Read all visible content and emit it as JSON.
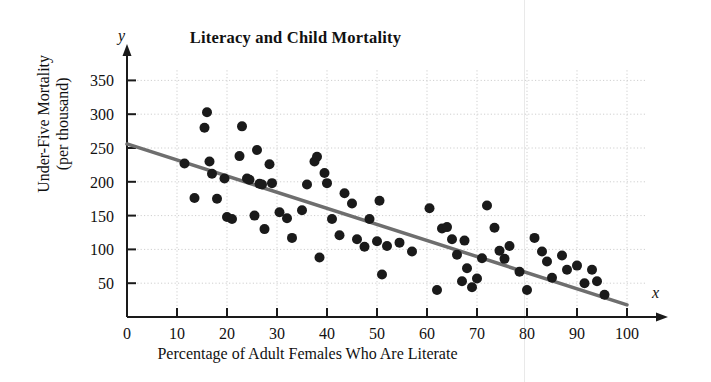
{
  "chart_data": {
    "type": "scatter",
    "title": "Literacy and Child Mortality",
    "xlabel": "Percentage of Adult Females Who Are Literate",
    "ylabel": "Under-Five Mortality\n(per thousand)",
    "ylabel_line1": "Under-Five Mortality",
    "ylabel_line2": "(per thousand)",
    "x_axis_variable": "x",
    "y_axis_variable": "y",
    "xlim": [
      0,
      100
    ],
    "ylim": [
      0,
      365
    ],
    "xticks": [
      0,
      10,
      20,
      30,
      40,
      50,
      60,
      70,
      80,
      90,
      100
    ],
    "yticks": [
      50,
      100,
      150,
      200,
      250,
      300,
      350
    ],
    "grid": true,
    "grid_style": "dotted",
    "legend": null,
    "point_color": "#1a1a1a",
    "point_radius_px": 5,
    "trendline": {
      "name": "least-squares regression line",
      "color": "#6e6e6e",
      "width_px": 3.5,
      "x0": 0,
      "y0": 256,
      "x1": 100,
      "y1": 18
    },
    "points": [
      {
        "x": 11.5,
        "y": 227
      },
      {
        "x": 13.5,
        "y": 176
      },
      {
        "x": 15.5,
        "y": 280
      },
      {
        "x": 16.0,
        "y": 303
      },
      {
        "x": 16.5,
        "y": 230
      },
      {
        "x": 17.0,
        "y": 212
      },
      {
        "x": 18.0,
        "y": 175
      },
      {
        "x": 19.5,
        "y": 205
      },
      {
        "x": 20.0,
        "y": 148
      },
      {
        "x": 21.0,
        "y": 145
      },
      {
        "x": 22.5,
        "y": 238
      },
      {
        "x": 23.0,
        "y": 282
      },
      {
        "x": 24.0,
        "y": 205
      },
      {
        "x": 24.5,
        "y": 203
      },
      {
        "x": 25.5,
        "y": 150
      },
      {
        "x": 26.0,
        "y": 247
      },
      {
        "x": 26.5,
        "y": 197
      },
      {
        "x": 27.0,
        "y": 196
      },
      {
        "x": 27.5,
        "y": 130
      },
      {
        "x": 28.5,
        "y": 226
      },
      {
        "x": 29.0,
        "y": 198
      },
      {
        "x": 30.5,
        "y": 155
      },
      {
        "x": 32.0,
        "y": 146
      },
      {
        "x": 33.0,
        "y": 117
      },
      {
        "x": 35.0,
        "y": 158
      },
      {
        "x": 36.0,
        "y": 196
      },
      {
        "x": 37.5,
        "y": 230
      },
      {
        "x": 38.0,
        "y": 237
      },
      {
        "x": 38.5,
        "y": 88
      },
      {
        "x": 39.5,
        "y": 213
      },
      {
        "x": 40.0,
        "y": 198
      },
      {
        "x": 41.0,
        "y": 145
      },
      {
        "x": 42.5,
        "y": 121
      },
      {
        "x": 43.5,
        "y": 183
      },
      {
        "x": 45.0,
        "y": 168
      },
      {
        "x": 46.0,
        "y": 115
      },
      {
        "x": 47.5,
        "y": 104
      },
      {
        "x": 48.5,
        "y": 145
      },
      {
        "x": 50.0,
        "y": 112
      },
      {
        "x": 50.5,
        "y": 172
      },
      {
        "x": 51.0,
        "y": 63
      },
      {
        "x": 52.0,
        "y": 105
      },
      {
        "x": 54.5,
        "y": 110
      },
      {
        "x": 57.0,
        "y": 97
      },
      {
        "x": 60.5,
        "y": 161
      },
      {
        "x": 62.0,
        "y": 40
      },
      {
        "x": 63.0,
        "y": 131
      },
      {
        "x": 64.0,
        "y": 133
      },
      {
        "x": 65.0,
        "y": 115
      },
      {
        "x": 66.0,
        "y": 92
      },
      {
        "x": 67.0,
        "y": 53
      },
      {
        "x": 67.5,
        "y": 113
      },
      {
        "x": 68.0,
        "y": 72
      },
      {
        "x": 69.0,
        "y": 44
      },
      {
        "x": 70.0,
        "y": 57
      },
      {
        "x": 71.0,
        "y": 87
      },
      {
        "x": 72.0,
        "y": 165
      },
      {
        "x": 73.5,
        "y": 132
      },
      {
        "x": 74.5,
        "y": 98
      },
      {
        "x": 75.5,
        "y": 86
      },
      {
        "x": 76.5,
        "y": 105
      },
      {
        "x": 78.5,
        "y": 67
      },
      {
        "x": 80.0,
        "y": 40
      },
      {
        "x": 81.5,
        "y": 117
      },
      {
        "x": 83.0,
        "y": 97
      },
      {
        "x": 84.0,
        "y": 82
      },
      {
        "x": 85.0,
        "y": 58
      },
      {
        "x": 87.0,
        "y": 91
      },
      {
        "x": 88.0,
        "y": 70
      },
      {
        "x": 90.0,
        "y": 76
      },
      {
        "x": 91.5,
        "y": 50
      },
      {
        "x": 93.0,
        "y": 70
      },
      {
        "x": 94.0,
        "y": 53
      },
      {
        "x": 95.5,
        "y": 33
      }
    ]
  }
}
